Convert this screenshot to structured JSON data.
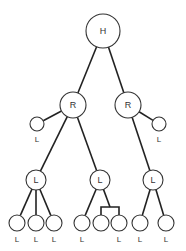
{
  "diagram": {
    "type": "tree",
    "nodes": [
      {
        "id": "h",
        "label": "H",
        "x": 103,
        "y": 31,
        "r": 17,
        "label_inside": true
      },
      {
        "id": "r1",
        "label": "R",
        "x": 73,
        "y": 105,
        "r": 13,
        "label_inside": true
      },
      {
        "id": "r2",
        "label": "R",
        "x": 128,
        "y": 105,
        "r": 13,
        "label_inside": true
      },
      {
        "id": "l_r1",
        "label": "L",
        "x": 37,
        "y": 124,
        "r": 7,
        "label_inside": false
      },
      {
        "id": "l_r2",
        "label": "L",
        "x": 159,
        "y": 124,
        "r": 7,
        "label_inside": false
      },
      {
        "id": "l1",
        "label": "L",
        "x": 36,
        "y": 180,
        "r": 10,
        "label_inside": true
      },
      {
        "id": "l2",
        "label": "L",
        "x": 100,
        "y": 180,
        "r": 10,
        "label_inside": true
      },
      {
        "id": "l3",
        "label": "L",
        "x": 153,
        "y": 180,
        "r": 10,
        "label_inside": true
      },
      {
        "id": "b1",
        "label": "L",
        "x": 17,
        "y": 223,
        "r": 8,
        "label_inside": false
      },
      {
        "id": "b2",
        "label": "L",
        "x": 36,
        "y": 223,
        "r": 8,
        "label_inside": false
      },
      {
        "id": "b3",
        "label": "L",
        "x": 54,
        "y": 223,
        "r": 8,
        "label_inside": false
      },
      {
        "id": "b4",
        "label": "L",
        "x": 82,
        "y": 223,
        "r": 8,
        "label_inside": false
      },
      {
        "id": "b5",
        "label": "",
        "x": 101,
        "y": 223,
        "r": 8,
        "label_inside": false
      },
      {
        "id": "b6",
        "label": "L",
        "x": 119,
        "y": 223,
        "r": 8,
        "label_inside": false
      },
      {
        "id": "b7",
        "label": "L",
        "x": 140,
        "y": 223,
        "r": 8,
        "label_inside": false
      },
      {
        "id": "b8",
        "label": "L",
        "x": 166,
        "y": 223,
        "r": 8,
        "label_inside": false
      }
    ],
    "edges": [
      {
        "from": "h",
        "to": "r1"
      },
      {
        "from": "h",
        "to": "r2"
      },
      {
        "from": "r1",
        "to": "l_r1"
      },
      {
        "from": "r1",
        "to": "l1"
      },
      {
        "from": "r1",
        "to": "l2"
      },
      {
        "from": "r2",
        "to": "l_r2"
      },
      {
        "from": "r2",
        "to": "l3"
      },
      {
        "from": "l1",
        "to": "b1"
      },
      {
        "from": "l1",
        "to": "b2"
      },
      {
        "from": "l1",
        "to": "b3"
      },
      {
        "from": "l2",
        "to": "b4"
      },
      {
        "from": "l3",
        "to": "b7"
      },
      {
        "from": "l3",
        "to": "b8"
      }
    ],
    "bracket": {
      "from": "l2",
      "stem_x": 110,
      "bar_y": 207,
      "children": [
        "b5",
        "b6"
      ]
    }
  }
}
